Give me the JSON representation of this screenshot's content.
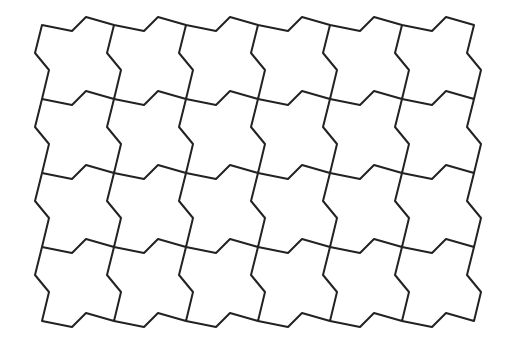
{
  "figure": {
    "title": "",
    "background": "#ffffff",
    "stroke_color": "#222222",
    "stroke_width": 2
  },
  "tessellation": {
    "columns": 6,
    "rows": 4,
    "origin": [
      42,
      25
    ],
    "step_x": [
      72,
      0
    ],
    "step_y": [
      0,
      74
    ],
    "tile_top_edge": [
      [
        0,
        0
      ],
      [
        30,
        6
      ],
      [
        44,
        -8
      ],
      [
        72,
        0
      ]
    ],
    "tile_left_edge": [
      [
        0,
        0
      ],
      [
        -7,
        28
      ],
      [
        7,
        45
      ],
      [
        0,
        74
      ]
    ]
  }
}
